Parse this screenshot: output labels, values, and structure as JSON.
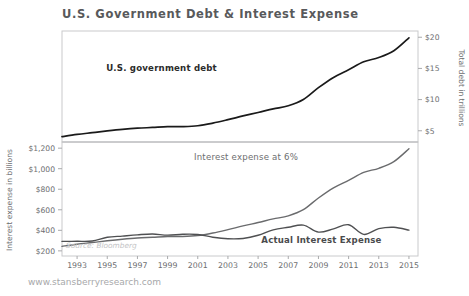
{
  "chart_data": {
    "type": "line",
    "title": "U.S. Government Debt & Interest Expense",
    "source_note": "Source: Bloomberg",
    "footer": "www.stansberryresearch.com",
    "xlabel": "",
    "x_tick_labels": [
      "1993",
      "1995",
      "1997",
      "1999",
      "2001",
      "2003",
      "2005",
      "2007",
      "2009",
      "2011",
      "2013",
      "2015"
    ],
    "xlim": [
      1992,
      2015.6
    ],
    "grid": false,
    "legend_position": "inline-annotations",
    "panels": [
      {
        "name": "upper",
        "axis": "right",
        "ylabel": "Total debt in trillions",
        "y_tick_labels": [
          "$20",
          "$15",
          "$10",
          "$5"
        ],
        "y_tick_values": [
          20,
          15,
          10,
          5
        ],
        "ylim": [
          3.2,
          21.0
        ]
      },
      {
        "name": "lower",
        "axis": "left",
        "ylabel": "Interest expense in billions",
        "y_tick_labels": [
          "$1,200",
          "$1,000",
          "$800",
          "$600",
          "$400",
          "$200"
        ],
        "y_tick_values": [
          1200,
          1000,
          800,
          600,
          400,
          200
        ],
        "ylim": [
          150,
          1260
        ]
      }
    ],
    "annotations": [
      {
        "text": "U.S. government debt",
        "x": 1998.6,
        "y_px": 71,
        "style": "bold-dark"
      },
      {
        "text": "Interest expense at 6%",
        "x": 2004.2,
        "y_px": 160,
        "style": "gray"
      },
      {
        "text": "Actual Interest Expense",
        "x": 2009.2,
        "y_px": 243,
        "style": "bold-dark"
      }
    ],
    "series": [
      {
        "name": "U.S. government debt",
        "unit": "trillions",
        "axis": "right",
        "color": "#1a1a1a",
        "x": [
          1992,
          1993,
          1994,
          1995,
          1996,
          1997,
          1998,
          1999,
          2000,
          2001,
          2002,
          2003,
          2004,
          2005,
          2006,
          2007,
          2008,
          2009,
          2010,
          2011,
          2012,
          2013,
          2014,
          2015
        ],
        "values": [
          4.06,
          4.41,
          4.69,
          4.97,
          5.22,
          5.41,
          5.53,
          5.66,
          5.67,
          5.81,
          6.23,
          6.78,
          7.38,
          7.93,
          8.51,
          9.01,
          10.02,
          11.91,
          13.56,
          14.79,
          16.07,
          16.74,
          17.82,
          19.9
        ]
      },
      {
        "name": "Interest expense at 6%",
        "unit": "billions",
        "axis": "left",
        "color": "#6a6b6d",
        "x": [
          1992,
          1993,
          1994,
          1995,
          1996,
          1997,
          1998,
          1999,
          2000,
          2001,
          2002,
          2003,
          2004,
          2005,
          2006,
          2007,
          2008,
          2009,
          2010,
          2011,
          2012,
          2013,
          2014,
          2015
        ],
        "values": [
          244,
          265,
          281,
          298,
          313,
          325,
          332,
          340,
          340,
          349,
          374,
          407,
          443,
          476,
          511,
          541,
          601,
          715,
          814,
          887,
          964,
          1004,
          1069,
          1194
        ]
      },
      {
        "name": "Actual Interest Expense",
        "unit": "billions",
        "axis": "left",
        "color": "#4f5052",
        "x": [
          1992,
          1993,
          1994,
          1995,
          1996,
          1997,
          1998,
          1999,
          2000,
          2001,
          2002,
          2003,
          2004,
          2005,
          2006,
          2007,
          2008,
          2009,
          2010,
          2011,
          2012,
          2013,
          2014,
          2015
        ],
        "values": [
          292,
          293,
          296,
          332,
          344,
          356,
          364,
          353,
          362,
          360,
          333,
          318,
          321,
          352,
          405,
          430,
          451,
          383,
          414,
          454,
          360,
          416,
          430,
          402
        ]
      }
    ]
  }
}
